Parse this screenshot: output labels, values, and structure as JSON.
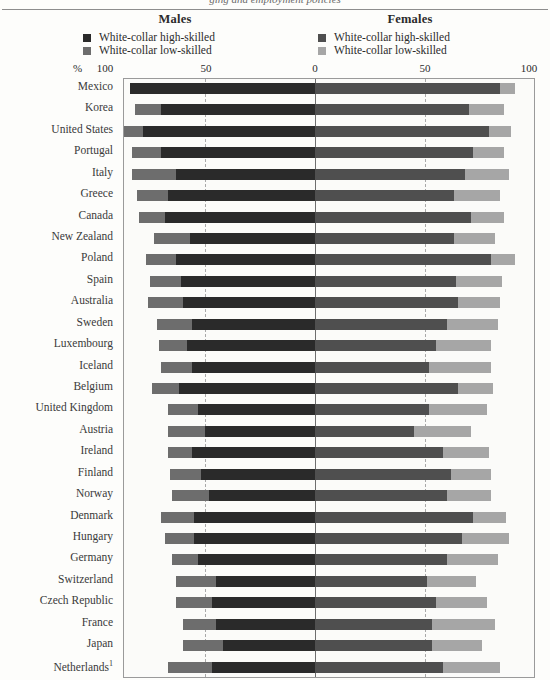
{
  "figure": {
    "title_fragment": "ging and employment policies",
    "legend": {
      "males_heading": "Males",
      "females_heading": "Females",
      "items": [
        {
          "label": "White-collar high-skilled",
          "color_male": "#2a2a2a",
          "color_female": "#4f4f4f"
        },
        {
          "label": "White-collar low-skilled",
          "color_male": "#6d6d6d",
          "color_female": "#a6a6a6"
        }
      ]
    },
    "axis": {
      "percent_symbol": "%",
      "ticks": [
        "100",
        "50",
        "0",
        "50",
        "100"
      ],
      "unit": "%"
    }
  },
  "chart_data": {
    "type": "bar",
    "subtype": "diverging-stacked-population-pyramid",
    "xlabel": "%",
    "ylabel": "",
    "xlim": [
      -100,
      100
    ],
    "grid": true,
    "legend_position": "top",
    "axis_ticks": [
      100,
      50,
      0,
      50,
      100
    ],
    "categories": [
      "Mexico",
      "Korea",
      "United States",
      "Portugal",
      "Italy",
      "Greece",
      "Canada",
      "New Zealand",
      "Poland",
      "Spain",
      "Australia",
      "Sweden",
      "Luxembourg",
      "Iceland",
      "Belgium",
      "United Kingdom",
      "Austria",
      "Ireland",
      "Finland",
      "Norway",
      "Denmark",
      "Hungary",
      "Germany",
      "Switzerland",
      "Czech Republic",
      "France",
      "Japan",
      "Netherlands"
    ],
    "category_footnotes": {
      "Netherlands": "1"
    },
    "series": [
      {
        "name": "Males - White-collar high-skilled",
        "side": "left",
        "color": "#2a2a2a",
        "values": [
          84,
          70,
          78,
          70,
          63,
          67,
          68,
          57,
          63,
          61,
          60,
          56,
          58,
          56,
          62,
          53,
          50,
          56,
          52,
          48,
          55,
          55,
          53,
          45,
          47,
          45,
          42,
          47
        ]
      },
      {
        "name": "Males - White-collar low-skilled",
        "side": "left",
        "color": "#6d6d6d",
        "values": [
          0,
          12,
          9,
          13,
          20,
          14,
          12,
          16,
          14,
          14,
          16,
          16,
          13,
          14,
          12,
          14,
          17,
          11,
          14,
          17,
          15,
          13,
          12,
          18,
          16,
          15,
          18,
          20
        ]
      },
      {
        "name": "Females - White-collar high-skilled",
        "side": "right",
        "color": "#4f4f4f",
        "values": [
          84,
          70,
          79,
          72,
          68,
          63,
          71,
          63,
          80,
          64,
          65,
          60,
          55,
          52,
          65,
          52,
          45,
          58,
          62,
          60,
          72,
          67,
          60,
          51,
          55,
          53,
          53,
          58
        ]
      },
      {
        "name": "Females - White-collar low-skilled",
        "side": "right",
        "color": "#a6a6a6",
        "values": [
          7,
          16,
          10,
          14,
          20,
          21,
          15,
          19,
          11,
          21,
          19,
          23,
          25,
          28,
          16,
          26,
          26,
          21,
          18,
          20,
          15,
          21,
          23,
          22,
          23,
          29,
          23,
          26
        ]
      }
    ]
  }
}
